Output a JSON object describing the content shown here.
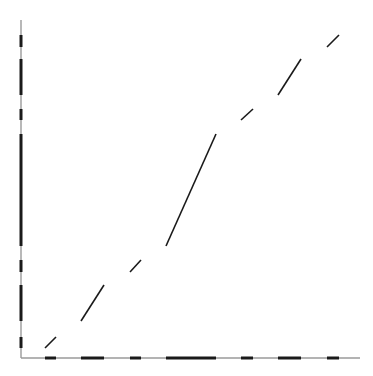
{
  "diagram": {
    "colors": {
      "background": "#ffffff",
      "axis": "#9a9a9a",
      "stroke": "#1a1a1a"
    },
    "axes": {
      "origin": [
        21,
        358
      ],
      "x_end": 360,
      "y_top": 20
    },
    "path_segments": [
      {
        "x1": 45,
        "y1": 348,
        "x2": 56,
        "y2": 337
      },
      {
        "x1": 81,
        "y1": 321,
        "x2": 104,
        "y2": 285
      },
      {
        "x1": 130,
        "y1": 272,
        "x2": 141,
        "y2": 260
      },
      {
        "x1": 166,
        "y1": 246,
        "x2": 216,
        "y2": 134
      },
      {
        "x1": 241,
        "y1": 120,
        "x2": 253,
        "y2": 109
      },
      {
        "x1": 278,
        "y1": 95,
        "x2": 301,
        "y2": 59
      },
      {
        "x1": 327,
        "y1": 47,
        "x2": 339,
        "y2": 35
      }
    ]
  }
}
